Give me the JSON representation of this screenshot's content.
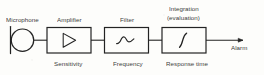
{
  "diagram": {
    "type": "block-diagram",
    "stroke_color": "#232323",
    "background_color": "#fdfdfb",
    "flow_direction": "left-to-right",
    "blocks": [
      {
        "id": "microphone",
        "top_label": "Microphone",
        "bottom_label": "",
        "symbol": "microphone-capsule",
        "shape": "circle-with-bar"
      },
      {
        "id": "amplifier",
        "top_label": "Amplifier",
        "bottom_label": "Sensitivity",
        "symbol": "triangle",
        "shape": "rectangle"
      },
      {
        "id": "filter",
        "top_label": "Filter",
        "bottom_label": "Frequency",
        "symbol": "filter-response-curve",
        "shape": "rectangle"
      },
      {
        "id": "integration",
        "top_label_line1": "Integration",
        "top_label_line2": "(evaluation)",
        "bottom_label": "Response time",
        "symbol": "integral-sign",
        "shape": "rectangle"
      }
    ],
    "output": {
      "label": "Alarm",
      "arrow": "arrow-right-icon"
    }
  }
}
